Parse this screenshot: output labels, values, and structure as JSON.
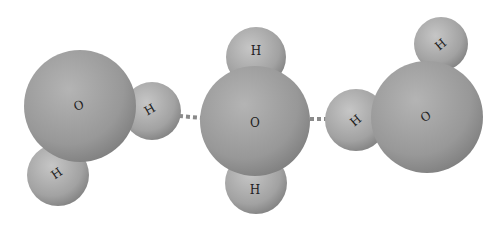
{
  "diagram": {
    "title": "",
    "molecules": [
      {
        "id": "water-left",
        "atoms": [
          {
            "element": "O",
            "label": "O"
          },
          {
            "element": "H",
            "label": "H"
          },
          {
            "element": "H",
            "label": "H"
          }
        ]
      },
      {
        "id": "water-center",
        "atoms": [
          {
            "element": "O",
            "label": "O"
          },
          {
            "element": "H",
            "label": "H"
          },
          {
            "element": "H",
            "label": "H"
          }
        ]
      },
      {
        "id": "water-right",
        "atoms": [
          {
            "element": "O",
            "label": "O"
          },
          {
            "element": "H",
            "label": "H"
          },
          {
            "element": "H",
            "label": "H"
          }
        ]
      }
    ],
    "hydrogen_bonds": [
      {
        "from": "water-left.H",
        "to": "water-center.O",
        "style": "dotted"
      },
      {
        "from": "water-center.O",
        "to": "water-right.H",
        "style": "dotted"
      }
    ],
    "colors": {
      "oxygen": "#9a9a9a",
      "hydrogen": "#a8a8a8",
      "bond": "#8a8a8a",
      "background": "#ffffff"
    }
  }
}
